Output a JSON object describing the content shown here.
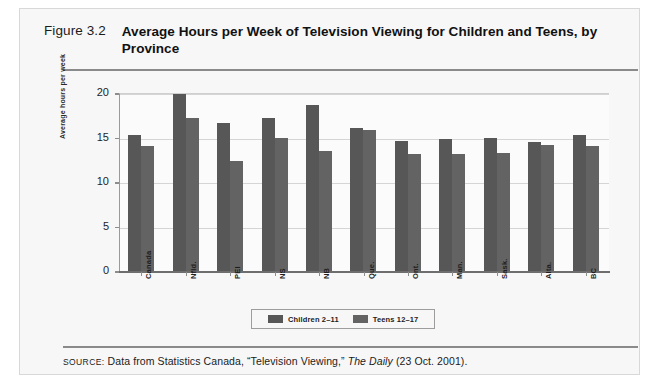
{
  "figure": {
    "number": "Figure 3.2",
    "title": "Average Hours per Week of Television Viewing for Children and Teens, by Province"
  },
  "source": {
    "label": "SOURCE:",
    "prefix": " Data from Statistics Canada, “Television Viewing,” ",
    "italic": "The Daily",
    "suffix": " (23 Oct. 2001)."
  },
  "chart_data": {
    "type": "bar",
    "title": "Average Hours per Week of Television Viewing for Children and Teens, by Province",
    "xlabel": "",
    "ylabel": "Average hours per week",
    "ylim": [
      0,
      20
    ],
    "yticks": [
      0,
      5,
      10,
      15,
      20
    ],
    "grid": true,
    "legend_position": "bottom-center",
    "categories": [
      "Canada",
      "Nfld.",
      "PEI",
      "NS",
      "NB",
      "Que.",
      "Ont.",
      "Man.",
      "Sask.",
      "Alta.",
      "BC"
    ],
    "series": [
      {
        "name": "Children 2–11",
        "color": "#575757",
        "values": [
          15.3,
          19.9,
          16.6,
          17.2,
          18.7,
          16.1,
          14.6,
          14.8,
          14.9,
          14.5,
          15.3
        ]
      },
      {
        "name": "Teens 12–17",
        "color": "#636363",
        "values": [
          14.0,
          17.2,
          12.4,
          15.0,
          13.5,
          15.8,
          13.2,
          13.2,
          13.3,
          14.2,
          14.0
        ]
      }
    ]
  }
}
